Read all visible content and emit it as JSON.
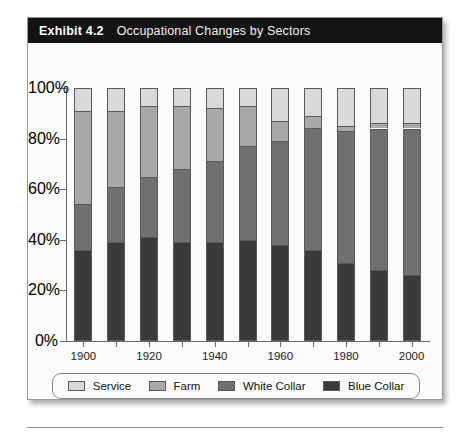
{
  "exhibit": {
    "number": "Exhibit 4.2",
    "title": "Occupational Changes by Sectors"
  },
  "chart_data": {
    "type": "bar",
    "subtype": "stacked-column-100",
    "title": "Occupational Changes by Sectors",
    "xlabel": "",
    "ylabel": "",
    "ylim": [
      0,
      100
    ],
    "yticks": [
      "0%",
      "20%",
      "40%",
      "60%",
      "80%",
      "100%"
    ],
    "ytick_values": [
      0,
      20,
      40,
      60,
      80,
      100
    ],
    "grid": false,
    "legend_position": "bottom",
    "categories": [
      "1900",
      "1910",
      "1920",
      "1930",
      "1940",
      "1950",
      "1960",
      "1970",
      "1980",
      "1990",
      "2000"
    ],
    "xtick_labels_shown": [
      "1900",
      "",
      "1920",
      "",
      "1940",
      "",
      "1960",
      "",
      "1980",
      "",
      "2000"
    ],
    "series": [
      {
        "name": "Blue Collar",
        "color": "#3a3a3a",
        "values": [
          36,
          39,
          41,
          39,
          39,
          40,
          38,
          36,
          31,
          28,
          26
        ]
      },
      {
        "name": "White Collar",
        "color": "#707070",
        "values": [
          18,
          22,
          24,
          29,
          32,
          37,
          41,
          48,
          52,
          56,
          58
        ]
      },
      {
        "name": "Farm",
        "color": "#a8a8a8",
        "values": [
          37,
          30,
          28,
          25,
          21,
          16,
          8,
          5,
          2,
          2,
          2
        ]
      },
      {
        "name": "Service",
        "color": "#d9d9d9",
        "values": [
          9,
          9,
          7,
          7,
          8,
          7,
          13,
          11,
          15,
          14,
          14
        ]
      }
    ],
    "stack_order_bottom_to_top": [
      "Blue Collar",
      "White Collar",
      "Farm",
      "Service"
    ],
    "cumulative_tops": {
      "1900": [
        36,
        54,
        91,
        100
      ],
      "1910": [
        39,
        61,
        91,
        100
      ],
      "1920": [
        41,
        65,
        93,
        100
      ],
      "1930": [
        39,
        68,
        93,
        100
      ],
      "1940": [
        39,
        71,
        92,
        100
      ],
      "1950": [
        40,
        77,
        93,
        100
      ],
      "1960": [
        38,
        79,
        87,
        100
      ],
      "1970": [
        36,
        84,
        89,
        100
      ],
      "1980": [
        31,
        83,
        85,
        100
      ],
      "1990": [
        28,
        84,
        86,
        100
      ],
      "2000": [
        26,
        84,
        86,
        100
      ]
    }
  },
  "legend": {
    "items": [
      {
        "label": "Service",
        "color": "#d9d9d9"
      },
      {
        "label": "Farm",
        "color": "#a8a8a8"
      },
      {
        "label": "White Collar",
        "color": "#707070"
      },
      {
        "label": "Blue Collar",
        "color": "#3a3a3a"
      }
    ]
  }
}
